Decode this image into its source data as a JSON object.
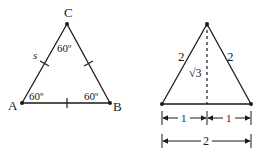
{
  "figure_left": {
    "vertices": {
      "A": "A",
      "B": "B",
      "C": "C"
    },
    "side_label": "s",
    "angles": {
      "A": "60º",
      "B": "60º",
      "C": "60º"
    }
  },
  "figure_right": {
    "left_side": "2",
    "right_side": "2",
    "height": "√3",
    "half_left": "1",
    "half_right": "1",
    "base": "2"
  }
}
